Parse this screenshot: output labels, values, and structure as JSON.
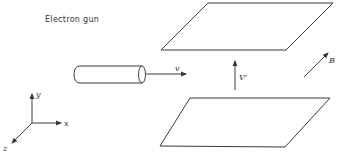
{
  "diagram": {
    "type": "physics-setup",
    "labels": {
      "electron_gun": "Electron gun",
      "velocity": "v",
      "voltage": "V'",
      "magnetic_field": "B",
      "axis_x": "x",
      "axis_y": "y",
      "axis_z": "z"
    },
    "elements": [
      {
        "id": "top-plate",
        "kind": "parallelogram",
        "points": [
          [
            208,
            3
          ],
          [
            333,
            3
          ],
          [
            286,
            50
          ],
          [
            161,
            50
          ]
        ]
      },
      {
        "id": "bottom-plate",
        "kind": "parallelogram",
        "points": [
          [
            190,
            98
          ],
          [
            330,
            98
          ],
          [
            285,
            147
          ],
          [
            160,
            146
          ]
        ]
      },
      {
        "id": "electron-gun",
        "kind": "cylinder",
        "x1": 75,
        "x2": 144,
        "y_top": 66,
        "y_bottom": 83
      },
      {
        "id": "velocity-arrow",
        "kind": "arrow",
        "from": [
          147,
          72
        ],
        "to": [
          187,
          72
        ]
      },
      {
        "id": "voltage-arrow",
        "kind": "arrow",
        "from": [
          235,
          90
        ],
        "to": [
          235,
          62
        ]
      },
      {
        "id": "b-field-arrow",
        "kind": "arrow",
        "from": [
          303,
          78
        ],
        "to": [
          328,
          54
        ]
      },
      {
        "id": "axes",
        "kind": "coordinate-axes",
        "origin": [
          32,
          123
        ]
      }
    ],
    "colors": {
      "line": "#3a3a3a",
      "text": "#333333",
      "background": "#ffffff"
    }
  }
}
